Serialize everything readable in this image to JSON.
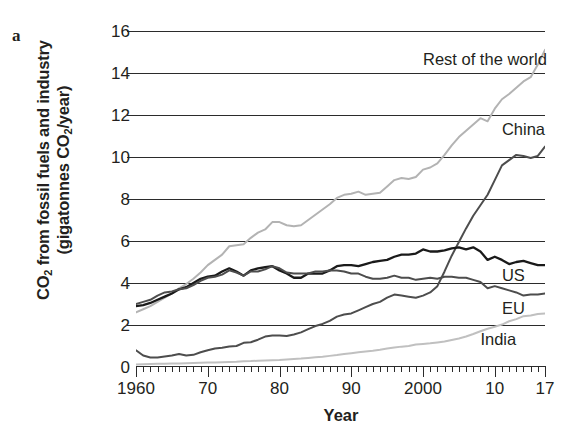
{
  "panel": {
    "label": "a"
  },
  "chart_data": {
    "type": "line",
    "title": "",
    "xlabel": "Year",
    "ylabel": "CO2 from fossil fuels and industry (gigatonnes CO2/year)",
    "ylabel_line1": "CO",
    "ylabel_line1_sub": "2",
    "ylabel_line1_rest": " from fossil fuels and industry",
    "ylabel_line2_pre": "(gigatonnes CO",
    "ylabel_line2_sub": "2",
    "ylabel_line2_post": "/year)",
    "xlim": [
      1960,
      2017
    ],
    "ylim": [
      0,
      16
    ],
    "grid": "horizontal gridlines at every major y tick",
    "legend": "inline labels at right end of each series",
    "y_ticks": [
      0,
      2,
      4,
      6,
      8,
      10,
      12,
      14,
      16
    ],
    "y_tick_labels": [
      "0",
      "2",
      "4",
      "6",
      "8",
      "10",
      "12",
      "14",
      "16"
    ],
    "x_major_ticks": [
      1960,
      1970,
      1980,
      1990,
      2000,
      2010,
      2017
    ],
    "x_tick_labels": [
      "1960",
      "70",
      "80",
      "90",
      "2000",
      "10",
      "17"
    ],
    "x_minor_tick_interval": 1,
    "x": [
      1960,
      1961,
      1962,
      1963,
      1964,
      1965,
      1966,
      1967,
      1968,
      1969,
      1970,
      1971,
      1972,
      1973,
      1974,
      1975,
      1976,
      1977,
      1978,
      1979,
      1980,
      1981,
      1982,
      1983,
      1984,
      1985,
      1986,
      1987,
      1988,
      1989,
      1990,
      1991,
      1992,
      1993,
      1994,
      1995,
      1996,
      1997,
      1998,
      1999,
      2000,
      2001,
      2002,
      2003,
      2004,
      2005,
      2006,
      2007,
      2008,
      2009,
      2010,
      2011,
      2012,
      2013,
      2014,
      2015,
      2016,
      2017
    ],
    "series": [
      {
        "name": "Rest of the world",
        "color": "#b3b3b3",
        "label_x": 2000,
        "label_y": 14.6,
        "values": [
          2.6,
          2.75,
          2.9,
          3.1,
          3.3,
          3.5,
          3.75,
          3.95,
          4.2,
          4.5,
          4.85,
          5.1,
          5.35,
          5.75,
          5.8,
          5.85,
          6.15,
          6.4,
          6.55,
          6.9,
          6.9,
          6.75,
          6.7,
          6.75,
          7.0,
          7.25,
          7.5,
          7.75,
          8.05,
          8.2,
          8.25,
          8.35,
          8.2,
          8.25,
          8.3,
          8.6,
          8.9,
          9.0,
          8.95,
          9.05,
          9.4,
          9.5,
          9.7,
          10.1,
          10.55,
          10.95,
          11.25,
          11.55,
          11.85,
          11.7,
          12.3,
          12.75,
          13.0,
          13.3,
          13.6,
          13.8,
          14.4,
          15.1
        ]
      },
      {
        "name": "China",
        "color": "#4d4d4d",
        "label_x": 2011,
        "label_y": 11.3,
        "values": [
          0.8,
          0.55,
          0.45,
          0.45,
          0.5,
          0.55,
          0.62,
          0.55,
          0.58,
          0.7,
          0.8,
          0.88,
          0.92,
          0.98,
          1.0,
          1.15,
          1.18,
          1.3,
          1.45,
          1.5,
          1.5,
          1.48,
          1.55,
          1.65,
          1.8,
          1.95,
          2.05,
          2.2,
          2.4,
          2.5,
          2.55,
          2.7,
          2.85,
          3.0,
          3.1,
          3.3,
          3.45,
          3.4,
          3.35,
          3.3,
          3.4,
          3.55,
          3.85,
          4.55,
          5.3,
          5.95,
          6.6,
          7.2,
          7.7,
          8.2,
          8.9,
          9.6,
          9.85,
          10.1,
          10.05,
          9.95,
          10.05,
          10.5
        ]
      },
      {
        "name": "US",
        "color": "#1a1a1a",
        "label_x": 2011,
        "label_y": 4.35,
        "values": [
          2.9,
          2.95,
          3.05,
          3.2,
          3.35,
          3.5,
          3.7,
          3.8,
          4.0,
          4.2,
          4.3,
          4.35,
          4.55,
          4.7,
          4.55,
          4.35,
          4.6,
          4.7,
          4.75,
          4.8,
          4.6,
          4.45,
          4.25,
          4.25,
          4.45,
          4.45,
          4.45,
          4.6,
          4.8,
          4.85,
          4.85,
          4.8,
          4.9,
          5.0,
          5.05,
          5.1,
          5.25,
          5.35,
          5.35,
          5.4,
          5.6,
          5.5,
          5.5,
          5.55,
          5.65,
          5.7,
          5.6,
          5.7,
          5.5,
          5.1,
          5.25,
          5.1,
          4.9,
          5.0,
          5.05,
          4.95,
          4.85,
          4.85
        ]
      },
      {
        "name": "EU",
        "color": "#4d4d4d",
        "label_x": 2011,
        "label_y": 2.75,
        "values": [
          3.0,
          3.1,
          3.2,
          3.4,
          3.55,
          3.6,
          3.7,
          3.75,
          3.9,
          4.1,
          4.25,
          4.3,
          4.4,
          4.6,
          4.5,
          4.35,
          4.55,
          4.55,
          4.65,
          4.8,
          4.7,
          4.5,
          4.45,
          4.45,
          4.45,
          4.55,
          4.55,
          4.6,
          4.6,
          4.55,
          4.45,
          4.45,
          4.3,
          4.2,
          4.2,
          4.25,
          4.35,
          4.25,
          4.25,
          4.15,
          4.2,
          4.25,
          4.2,
          4.3,
          4.3,
          4.25,
          4.25,
          4.15,
          4.05,
          3.75,
          3.85,
          3.75,
          3.65,
          3.55,
          3.4,
          3.45,
          3.45,
          3.5
        ]
      },
      {
        "name": "India",
        "color": "#c0c0c0",
        "label_x": 2008,
        "label_y": 1.3,
        "values": [
          0.12,
          0.13,
          0.14,
          0.15,
          0.16,
          0.17,
          0.17,
          0.18,
          0.19,
          0.2,
          0.21,
          0.22,
          0.23,
          0.24,
          0.25,
          0.27,
          0.28,
          0.3,
          0.31,
          0.32,
          0.33,
          0.36,
          0.38,
          0.4,
          0.43,
          0.46,
          0.49,
          0.53,
          0.57,
          0.62,
          0.66,
          0.7,
          0.74,
          0.77,
          0.82,
          0.88,
          0.93,
          0.97,
          1.0,
          1.07,
          1.1,
          1.13,
          1.17,
          1.21,
          1.29,
          1.36,
          1.45,
          1.57,
          1.7,
          1.82,
          1.92,
          2.02,
          2.18,
          2.28,
          2.42,
          2.45,
          2.52,
          2.55
        ]
      }
    ]
  }
}
